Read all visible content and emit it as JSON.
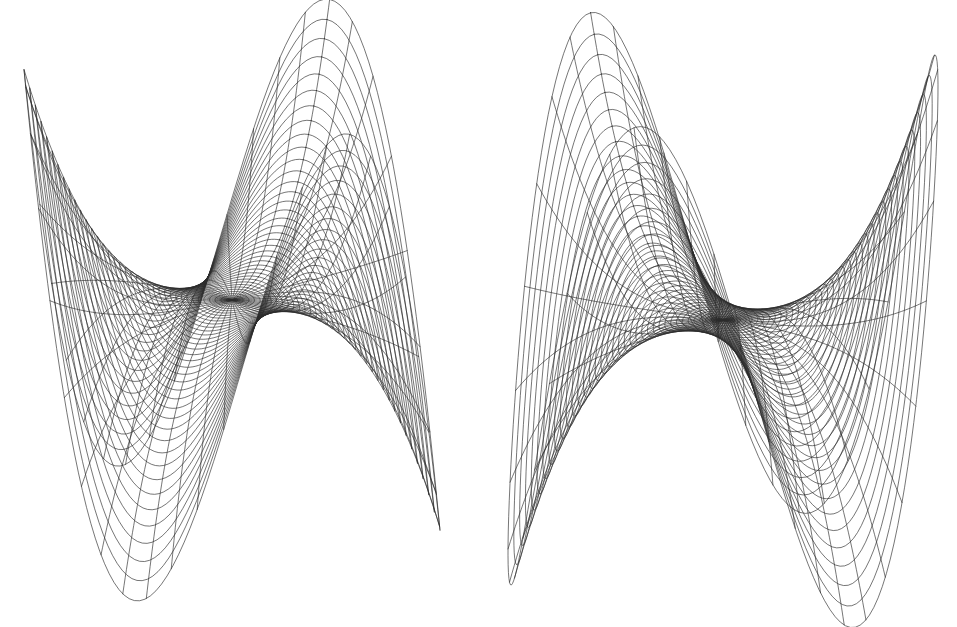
{
  "figure": {
    "title": "",
    "background_color": "#ffffff",
    "line_color": "#2b2b2b",
    "width": 957,
    "height": 627,
    "panel_count": 2
  },
  "panels": [
    {
      "id": "left",
      "name": "monkey-saddle-view-a",
      "label": "",
      "viewport": {
        "x": 0,
        "y": 0,
        "width": 478,
        "height": 627
      }
    },
    {
      "id": "right",
      "name": "monkey-saddle-view-b",
      "label": "",
      "viewport": {
        "x": 478,
        "y": 0,
        "width": 479,
        "height": 627
      }
    }
  ],
  "chart_data": [
    {
      "type": "line",
      "subtype": "wireframe-surface-3d",
      "title": "",
      "xlabel": "",
      "ylabel": "",
      "zlabel": "",
      "grid": false,
      "legend": null,
      "axes_visible": false,
      "tick_labels": [],
      "surface": {
        "name": "monkey saddle",
        "equation": "z = r^3 * cos(3*theta)",
        "domain": {
          "r_min": 0.0,
          "r_max": 1.0,
          "theta_min": 0,
          "theta_max": 6.283185307
        },
        "mesh": {
          "radial_lines": 37,
          "angular_lines": 49,
          "u_samples": 220,
          "v_samples": 220
        },
        "z_scale": 1.0,
        "peaks": 3,
        "valleys": 3
      },
      "view": {
        "azimuth_deg": 62,
        "elevation_deg": 22,
        "roll_deg": 0,
        "projection": "orthographic",
        "scale": 208,
        "center_px": [
          232,
          300
        ],
        "z_scale_px": 250
      },
      "landmarks": {
        "primary_peak_px": [
          182,
          52
        ],
        "secondary_peak_px": [
          414,
          105
        ],
        "left_lobe_tip_px": [
          62,
          545
        ],
        "lower_lobe_tip_px": [
          285,
          582
        ],
        "saddle_center_px": [
          205,
          315
        ]
      }
    },
    {
      "type": "line",
      "subtype": "wireframe-surface-3d",
      "title": "",
      "xlabel": "",
      "ylabel": "",
      "zlabel": "",
      "grid": false,
      "legend": null,
      "axes_visible": false,
      "tick_labels": [],
      "surface": {
        "name": "monkey saddle",
        "equation": "z = r^3 * cos(3*theta)",
        "domain": {
          "r_min": 0.0,
          "r_max": 1.0,
          "theta_min": 0,
          "theta_max": 6.283185307
        },
        "mesh": {
          "radial_lines": 37,
          "angular_lines": 49,
          "u_samples": 220,
          "v_samples": 220
        },
        "z_scale": 1.0,
        "peaks": 3,
        "valleys": 3
      },
      "view": {
        "azimuth_deg": 128,
        "elevation_deg": 18,
        "roll_deg": 0,
        "projection": "orthographic",
        "scale": 215,
        "center_px": [
          245,
          320
        ],
        "z_scale_px": 268
      },
      "landmarks": {
        "primary_peak_px": [
          718,
          57
        ],
        "secondary_peak_px": [
          840,
          172
        ],
        "thin_spike_tip_px": [
          541,
          130
        ],
        "lower_lobe_tip_px": [
          712,
          588
        ],
        "right_lobe_tip_px": [
          885,
          466
        ],
        "saddle_center_px": [
          760,
          408
        ]
      }
    }
  ]
}
